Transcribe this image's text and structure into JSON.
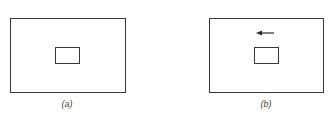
{
  "figure": {
    "panels": [
      {
        "id": "a",
        "label": "(a)",
        "has_arrow": false
      },
      {
        "id": "b",
        "label": "(b)",
        "has_arrow": true,
        "arrow_direction": "left"
      }
    ],
    "colors": {
      "line": "#3a3a3a",
      "background": "#ffffff",
      "label": "#444444"
    }
  }
}
